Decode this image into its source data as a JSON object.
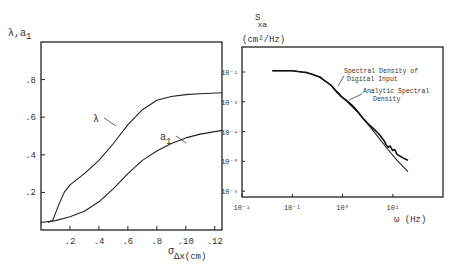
{
  "chart_data": [
    {
      "type": "line",
      "title": "",
      "ylabel": "λ,a1",
      "xlabel": "σΔx(cm)",
      "xlabel_main": "σ",
      "xlabel_sub": "Δx(cm)",
      "ylabel_main": "λ,a",
      "ylabel_sub": "1",
      "xlim": [
        0.0,
        0.125
      ],
      "ylim": [
        0.0,
        1.0
      ],
      "x_ticks": [
        0.02,
        0.04,
        0.06,
        0.08,
        0.1,
        0.12
      ],
      "x_tick_labels": [
        ".2",
        ".4",
        ".6",
        ".8",
        ".10",
        ".12"
      ],
      "y_ticks": [
        0.2,
        0.4,
        0.6,
        0.8
      ],
      "y_tick_labels": [
        ".2",
        ".4",
        ".6",
        ".8"
      ],
      "grid": false,
      "series": [
        {
          "name": "λ",
          "label": "λ",
          "x": [
            0.005,
            0.008,
            0.012,
            0.016,
            0.02,
            0.03,
            0.04,
            0.05,
            0.06,
            0.07,
            0.08,
            0.09,
            0.1,
            0.11,
            0.125
          ],
          "y": [
            0.04,
            0.05,
            0.13,
            0.2,
            0.24,
            0.3,
            0.37,
            0.46,
            0.56,
            0.64,
            0.69,
            0.71,
            0.72,
            0.725,
            0.73
          ]
        },
        {
          "name": "a1",
          "label_main": "a",
          "label_sub": "1",
          "x": [
            0.0,
            0.01,
            0.02,
            0.03,
            0.04,
            0.05,
            0.06,
            0.07,
            0.08,
            0.09,
            0.1,
            0.11,
            0.125
          ],
          "y": [
            0.04,
            0.05,
            0.07,
            0.1,
            0.15,
            0.22,
            0.3,
            0.37,
            0.42,
            0.46,
            0.49,
            0.51,
            0.53
          ]
        }
      ]
    },
    {
      "type": "line",
      "title": "",
      "ylabel": "Sxa (cm²/Hz)",
      "ylabel_line1": "S",
      "ylabel_sub": "xa",
      "ylabel_line2": "(cm²/Hz)",
      "xlabel": "ω (Hz)",
      "xscale": "log",
      "yscale": "log",
      "xlim": [
        0.01,
        100
      ],
      "ylim": [
        6e-07,
        0.04
      ],
      "x_ticks": [
        0.01,
        0.1,
        1,
        10
      ],
      "x_tick_labels": [
        "10⁻²",
        "10⁻¹",
        "10⁰",
        "10¹"
      ],
      "y_ticks": [
        0.01,
        0.001,
        0.0001,
        1e-05,
        1e-06
      ],
      "y_tick_labels": [
        "10⁻²",
        "10⁻³",
        "10⁻⁴",
        "10⁻⁵",
        "10⁻⁶"
      ],
      "grid": false,
      "annotations": [
        {
          "text_line1": "Spectral Density of",
          "text_line2": "Digital Input",
          "target": "digital"
        },
        {
          "text_line1": "Analytic Spectral",
          "text_line2": "Density",
          "target": "analytic"
        }
      ],
      "series": [
        {
          "name": "Analytic Spectral Density",
          "x": [
            0.04,
            0.1,
            0.2,
            0.35,
            0.6,
            1.0,
            2.0,
            4.0,
            8.0,
            12.0,
            20.0
          ],
          "y": [
            0.011,
            0.011,
            0.0095,
            0.0068,
            0.0035,
            0.0014,
            0.00045,
            0.00011,
            2.5e-05,
            1.1e-05,
            4.5e-06
          ]
        },
        {
          "name": "Spectral Density of Digital Input",
          "x": [
            0.04,
            0.1,
            0.2,
            0.35,
            0.6,
            1.0,
            2.0,
            4.0,
            8.0,
            12.0,
            20.0
          ],
          "y": [
            0.011,
            0.011,
            0.0095,
            0.0068,
            0.0035,
            0.0014,
            0.00047,
            0.00013,
            3.4e-05,
            1.8e-05,
            1.1e-05
          ]
        }
      ]
    }
  ]
}
